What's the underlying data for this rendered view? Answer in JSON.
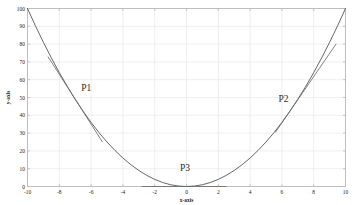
{
  "figure": {
    "background_color": "#ffffff",
    "frame_color": "#b8b8b8",
    "grid_color": "#e8e8e8",
    "curve_color": "#4a4a4a",
    "tangent_color": "#6b6b6b",
    "text_color": "#1a1a1a"
  },
  "chart_data": {
    "type": "line",
    "title": "",
    "xlabel": "x-axis",
    "ylabel": "y-axis",
    "xlim": [
      -10,
      10
    ],
    "ylim": [
      0,
      100
    ],
    "grid": true,
    "legend": null,
    "xticks": [
      -10,
      -8,
      -6,
      -4,
      -2,
      0,
      2,
      4,
      6,
      8,
      10
    ],
    "xticklabels": [
      "-10",
      "-8",
      "-6",
      "-4",
      "-2",
      "0",
      "2",
      "4",
      "6",
      "8",
      "10"
    ],
    "yticks": [
      0,
      10,
      20,
      30,
      40,
      50,
      60,
      70,
      80,
      90,
      100
    ],
    "yticklabels": [
      "0",
      "10",
      "20",
      "30",
      "40",
      "50",
      "60",
      "70",
      "80",
      "90",
      "100"
    ],
    "series": [
      {
        "name": "parabola",
        "equation": "y = x^2",
        "x": [
          -10,
          -9.5,
          -9,
          -8.5,
          -8,
          -7.5,
          -7,
          -6.5,
          -6,
          -5.5,
          -5,
          -4.5,
          -4,
          -3.5,
          -3,
          -2.5,
          -2,
          -1.5,
          -1,
          -0.5,
          0,
          0.5,
          1,
          1.5,
          2,
          2.5,
          3,
          3.5,
          4,
          4.5,
          5,
          5.5,
          6,
          6.5,
          7,
          7.5,
          8,
          8.5,
          9,
          9.5,
          10
        ],
        "y": [
          100,
          90.25,
          81,
          72.25,
          64,
          56.25,
          49,
          42.25,
          36,
          30.25,
          25,
          20.25,
          16,
          12.25,
          9,
          6.25,
          4,
          2.25,
          1,
          0.25,
          0,
          0.25,
          1,
          2.25,
          4,
          6.25,
          9,
          12.25,
          16,
          20.25,
          25,
          30.25,
          36,
          42.25,
          49,
          56.25,
          64,
          72.25,
          81,
          90.25,
          100
        ]
      },
      {
        "name": "tangent-at-P1",
        "equation": "y = -14x - 49",
        "tangent_point": [
          -7,
          49
        ],
        "slope": -14,
        "x_extent": [
          -8.7,
          -5.3
        ]
      },
      {
        "name": "tangent-at-P2",
        "equation": "y = 13x - 42.25",
        "tangent_point": [
          6.5,
          42.25
        ],
        "slope": 13,
        "x_extent": [
          5.6,
          9.4
        ]
      },
      {
        "name": "tangent-at-P3",
        "equation": "y = 0",
        "tangent_point": [
          0,
          0
        ],
        "slope": 0,
        "x_extent": [
          -2.8,
          2.5
        ]
      }
    ],
    "annotations": [
      {
        "text": "P1",
        "x": -6.3,
        "y": 53.5
      },
      {
        "text": "P2",
        "x": 6.1,
        "y": 47.5
      },
      {
        "text": "P3",
        "x": -0.1,
        "y": 8.5
      }
    ]
  }
}
